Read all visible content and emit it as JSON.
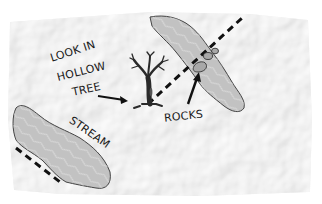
{
  "map": {
    "title": "Treasure map sketch",
    "paper_color": "#f4f4f4",
    "water_color": "#c2c2c2",
    "ink_color": "#1a1a1a",
    "labels": {
      "instruction_line1": "LOOK IN",
      "instruction_line2": "HOLLOW",
      "instruction_line3": "TREE",
      "rocks": "ROCKS",
      "stream": "STREAM"
    },
    "features": [
      {
        "name": "hollow-tree",
        "type": "landmark"
      },
      {
        "name": "rocks",
        "type": "landmark",
        "count": 3
      },
      {
        "name": "stream",
        "type": "water"
      },
      {
        "name": "lake",
        "type": "water"
      },
      {
        "name": "dashed-path-upper",
        "type": "trail"
      },
      {
        "name": "dashed-path-lower",
        "type": "trail"
      }
    ]
  }
}
